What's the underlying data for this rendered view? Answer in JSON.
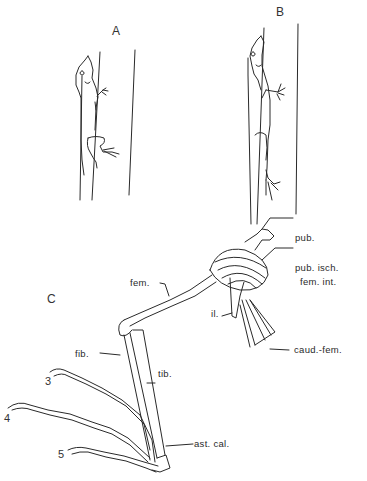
{
  "figure": {
    "panels": [
      {
        "id": "A",
        "label": "A",
        "description": "Lizard clinging to narrow perch, limbs flexed"
      },
      {
        "id": "B",
        "label": "B",
        "description": "Lizard on broad perch, limbs extended"
      },
      {
        "id": "C",
        "label": "C",
        "description": "Hindlimb skeleton and musculature"
      }
    ],
    "anatomy_labels": {
      "pub": "pub.",
      "pub_isch": "pub. isch.",
      "fem_int": "fem. int.",
      "fem": "fem.",
      "il": "il.",
      "caud_fem": "caud.-fem.",
      "fib": "fib.",
      "tib": "tib.",
      "ast_cal": "ast. cal."
    },
    "digits": [
      "3",
      "4",
      "5"
    ]
  },
  "colors": {
    "line": "#2a2a2a",
    "background": "#ffffff"
  }
}
